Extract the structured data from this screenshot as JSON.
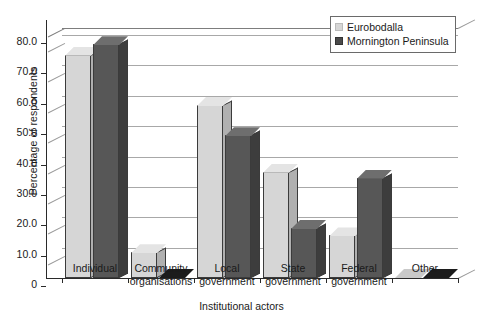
{
  "chart_data": {
    "type": "bar",
    "title": "",
    "xlabel": "Institutional actors",
    "ylabel": "Percentage of respondents",
    "ylim": [
      0,
      80
    ],
    "ytick_labels": [
      "80.0",
      "70.0",
      "60.0",
      "50.0",
      "40.0",
      "30.0",
      "20.0",
      "10.0",
      "0"
    ],
    "ytick_values": [
      80,
      70,
      60,
      50,
      40,
      30,
      20,
      10,
      0
    ],
    "grid": true,
    "legend_position": "top-right",
    "style": "3d-clustered-column",
    "categories": [
      "Individual",
      "Community\norganisations",
      "Local\ngovernment",
      "State\ngovernment",
      "Federal\ngovernment",
      "Other"
    ],
    "series": [
      {
        "name": "Eurobodalla",
        "color": "#d6d6d6",
        "values": [
          73.5,
          8.5,
          57.0,
          35.0,
          14.0,
          0.0
        ]
      },
      {
        "name": "Mornington Peninsula",
        "color": "#575757",
        "values": [
          77.0,
          0.0,
          47.0,
          16.5,
          33.0,
          0.0
        ]
      }
    ]
  },
  "legend": {
    "entries": [
      {
        "label": "Eurobodalla",
        "swatch": "legend-swatch-light"
      },
      {
        "label": "Mornington Peninsula",
        "swatch": "legend-swatch-dark"
      }
    ]
  }
}
